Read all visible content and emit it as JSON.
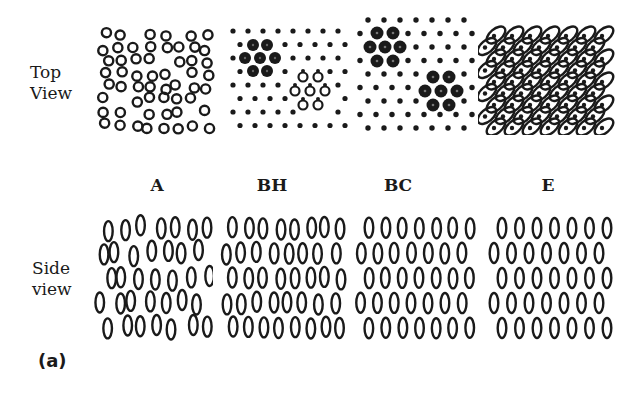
{
  "figure": {
    "row_labels": {
      "top": [
        "Top",
        "View"
      ],
      "side": [
        "Side",
        "view"
      ]
    },
    "column_labels": [
      "A",
      "BH",
      "BC",
      "E"
    ],
    "caption": "(a)",
    "ink_color": "#1a1a1a",
    "panels": [
      {
        "id": "A",
        "top_pattern": "random-open-circles",
        "side_pattern": "disordered-ellipses"
      },
      {
        "id": "BH",
        "top_pattern": "dots-with-large-clusters-and-ring-triangle",
        "side_pattern": "layered-ellipses-chains"
      },
      {
        "id": "BC",
        "top_pattern": "dots-with-large-dot-clusters",
        "side_pattern": "staggered-ellipses"
      },
      {
        "id": "E",
        "top_pattern": "tilted-ellipse-lattice",
        "side_pattern": "staggered-ellipses"
      }
    ]
  }
}
